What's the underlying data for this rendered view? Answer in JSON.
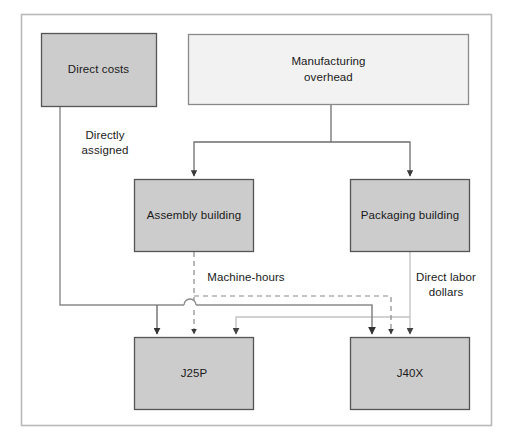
{
  "diagram": {
    "frame": {
      "border_color": "#b9b9b9",
      "background": "#ffffff"
    },
    "colors": {
      "node_fill_gray": "#cccccc",
      "node_fill_light": "#f2f2f2",
      "node_border": "#555555",
      "arrow_dark": "#444444",
      "arrow_mid": "#777777",
      "arrow_light": "#c4c4c4",
      "text": "#1a1a1a"
    },
    "nodes": [
      {
        "id": "direct-costs",
        "label": "Direct costs",
        "fill": "gray",
        "x": 41,
        "y": 33,
        "w": 115,
        "h": 74
      },
      {
        "id": "manufacturing-overhead",
        "label": "Manufacturing\noverhead",
        "fill": "light",
        "x": 188,
        "y": 34,
        "w": 281,
        "h": 71
      },
      {
        "id": "assembly-building",
        "label": "Assembly building",
        "fill": "gray",
        "x": 134,
        "y": 179,
        "w": 120,
        "h": 73
      },
      {
        "id": "packaging-building",
        "label": "Packaging building",
        "fill": "gray",
        "x": 350,
        "y": 179,
        "w": 120,
        "h": 73
      },
      {
        "id": "job-j25p",
        "label": "J25P",
        "fill": "gray",
        "x": 134,
        "y": 337,
        "w": 120,
        "h": 73
      },
      {
        "id": "job-j40x",
        "label": "J40X",
        "fill": "gray",
        "x": 350,
        "y": 337,
        "w": 120,
        "h": 73
      }
    ],
    "edge_labels": [
      {
        "id": "directly-assigned",
        "text": "Directly\nassigned",
        "x": 70,
        "y": 128,
        "w": 70
      },
      {
        "id": "machine-hours",
        "text": "Machine-hours",
        "x": 200,
        "y": 270,
        "w": 90
      },
      {
        "id": "direct-labor-dollars",
        "text": "Direct labor\ndollars",
        "x": 406,
        "y": 270,
        "w": 78
      }
    ],
    "edges": [
      {
        "id": "overhead-to-assembly",
        "from": "manufacturing-overhead",
        "to": "assembly-building",
        "style": "solid",
        "color": "arrow_mid"
      },
      {
        "id": "overhead-to-packaging",
        "from": "manufacturing-overhead",
        "to": "packaging-building",
        "style": "solid",
        "color": "arrow_mid"
      },
      {
        "id": "direct-costs-to-j25p",
        "from": "direct-costs",
        "to": "job-j25p",
        "style": "solid",
        "color": "arrow_dark",
        "label": "Directly assigned"
      },
      {
        "id": "direct-costs-to-j40x",
        "from": "direct-costs",
        "to": "job-j40x",
        "style": "solid",
        "color": "arrow_dark",
        "label": "Directly assigned"
      },
      {
        "id": "assembly-to-j25p",
        "from": "assembly-building",
        "to": "job-j25p",
        "style": "dashed",
        "color": "arrow_mid",
        "label": "Machine-hours"
      },
      {
        "id": "assembly-to-j40x",
        "from": "assembly-building",
        "to": "job-j40x",
        "style": "dashed",
        "color": "arrow_mid",
        "label": "Machine-hours"
      },
      {
        "id": "packaging-to-j25p",
        "from": "packaging-building",
        "to": "job-j25p",
        "style": "solid",
        "color": "arrow_light",
        "label": "Direct labor dollars"
      },
      {
        "id": "packaging-to-j40x",
        "from": "packaging-building",
        "to": "job-j40x",
        "style": "solid",
        "color": "arrow_light",
        "label": "Direct labor dollars"
      }
    ]
  }
}
